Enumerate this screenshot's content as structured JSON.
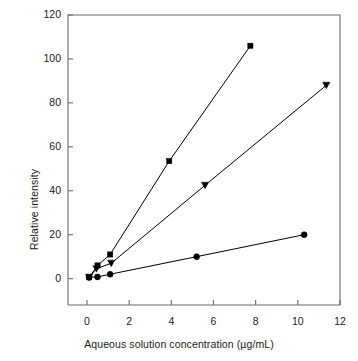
{
  "chart_data": {
    "type": "scatter",
    "title": "",
    "xlabel": "Aqueous solution concentration (µg/mL)",
    "ylabel": "Relative intensity",
    "xlim": [
      -0.9,
      12.0
    ],
    "ylim": [
      -12.0,
      120.0
    ],
    "xticks": [
      0,
      2,
      4,
      6,
      8,
      10,
      12
    ],
    "xtick_labels": [
      "0",
      "2",
      "4",
      "6",
      "8",
      "10",
      "12"
    ],
    "yticks": [
      0,
      20,
      40,
      60,
      80,
      100,
      120
    ],
    "ytick_labels": [
      "0",
      "20",
      "40",
      "60",
      "80",
      "100",
      "120"
    ],
    "grid": false,
    "legend": "none",
    "series": [
      {
        "name": "series-square",
        "marker": "square",
        "color": "#000000",
        "points": [
          {
            "x": 0.1,
            "y": 0.6
          },
          {
            "x": 0.5,
            "y": 6.0
          },
          {
            "x": 1.1,
            "y": 11.0
          },
          {
            "x": 3.9,
            "y": 53.5
          },
          {
            "x": 7.75,
            "y": 106.0
          }
        ]
      },
      {
        "name": "series-triangle",
        "marker": "triangle",
        "color": "#000000",
        "points": [
          {
            "x": 0.1,
            "y": 0.6
          },
          {
            "x": 0.45,
            "y": 4.5
          },
          {
            "x": 1.15,
            "y": 7.0
          },
          {
            "x": 5.6,
            "y": 42.5
          },
          {
            "x": 11.35,
            "y": 88.0
          }
        ]
      },
      {
        "name": "series-circle",
        "marker": "circle",
        "color": "#000000",
        "points": [
          {
            "x": 0.1,
            "y": 0.6
          },
          {
            "x": 0.5,
            "y": 0.8
          },
          {
            "x": 1.1,
            "y": 2.0
          },
          {
            "x": 5.2,
            "y": 10.0
          },
          {
            "x": 10.3,
            "y": 20.0
          }
        ]
      }
    ]
  },
  "axes": {
    "frame_color": "#6b6b6b",
    "line_color": "#1a1a1a",
    "marker_color": "#000000"
  }
}
